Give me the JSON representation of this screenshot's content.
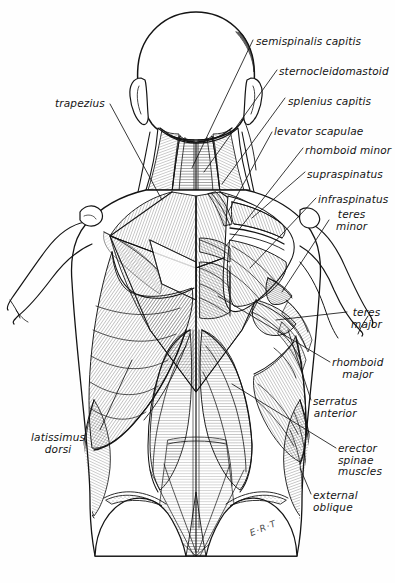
{
  "figure": {
    "signature": "E·R·T",
    "background_color": "#fefefe",
    "ink_color": "#141414"
  },
  "labels": [
    {
      "id": "semispinalis-capitis",
      "text": "semispinalis capitis",
      "x": 256,
      "y": 36,
      "align": "left"
    },
    {
      "id": "sternocleidomastoid",
      "text": "sternocleidomastoid",
      "x": 279,
      "y": 66,
      "align": "left"
    },
    {
      "id": "splenius-capitis",
      "text": "splenius capitis",
      "x": 288,
      "y": 96,
      "align": "left"
    },
    {
      "id": "levator-scapulae",
      "text": "levator scapulae",
      "x": 274,
      "y": 126,
      "align": "left"
    },
    {
      "id": "rhomboid-minor",
      "text": "rhomboid minor",
      "x": 305,
      "y": 145,
      "align": "left"
    },
    {
      "id": "supraspinatus",
      "text": "supraspinatus",
      "x": 307,
      "y": 169,
      "align": "left"
    },
    {
      "id": "infraspinatus",
      "text": "infraspinatus",
      "x": 318,
      "y": 194,
      "align": "left"
    },
    {
      "id": "teres-minor",
      "text": "teres\nminor",
      "x": 331,
      "y": 209,
      "align": "left"
    },
    {
      "id": "teres-major",
      "text": "teres\nmajor",
      "x": 349,
      "y": 307,
      "align": "left"
    },
    {
      "id": "rhomboid-major",
      "text": "rhomboid\nmajor",
      "x": 332,
      "y": 357,
      "align": "left"
    },
    {
      "id": "serratus-anterior",
      "text": "serratus\nanterior",
      "x": 313,
      "y": 396,
      "align": "left"
    },
    {
      "id": "erector-spinae-muscles",
      "text": "erector\nspinae\nmuscles",
      "x": 338,
      "y": 443,
      "align": "left"
    },
    {
      "id": "external-oblique",
      "text": "external\noblique",
      "x": 313,
      "y": 490,
      "align": "left"
    },
    {
      "id": "trapezius",
      "text": "trapezius",
      "x": 55,
      "y": 98,
      "align": "left"
    },
    {
      "id": "latissimus-dorsi",
      "text": "latissimus\ndorsi",
      "x": 31,
      "y": 432,
      "align": "left"
    }
  ],
  "anatomy": {
    "view": "posterior",
    "regions": [
      "head",
      "neck",
      "shoulders",
      "upper-back",
      "lower-back",
      "arms",
      "gluteal"
    ],
    "muscles_depicted": [
      "semispinalis capitis",
      "sternocleidomastoid",
      "splenius capitis",
      "levator scapulae",
      "rhomboid minor",
      "supraspinatus",
      "infraspinatus",
      "teres minor",
      "teres major",
      "rhomboid major",
      "serratus anterior",
      "erector spinae muscles",
      "external oblique",
      "trapezius",
      "latissimus dorsi"
    ]
  }
}
